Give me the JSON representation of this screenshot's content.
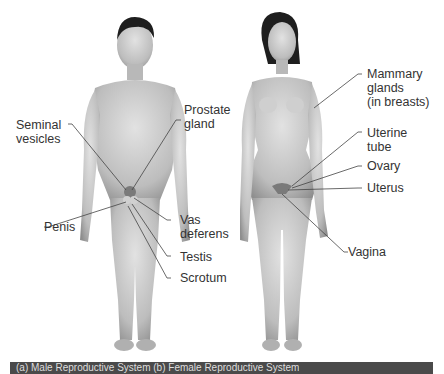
{
  "figures": {
    "male": {
      "labels": [
        {
          "id": "seminal-vesicles",
          "text": "Seminal\nvesicles"
        },
        {
          "id": "prostate-gland",
          "text": "Prostate\ngland"
        },
        {
          "id": "penis",
          "text": "Penis"
        },
        {
          "id": "vas-deferens",
          "text": "Vas\ndeferens"
        },
        {
          "id": "testis",
          "text": "Testis"
        },
        {
          "id": "scrotum",
          "text": "Scrotum"
        }
      ]
    },
    "female": {
      "labels": [
        {
          "id": "mammary-glands",
          "text": "Mammary\nglands\n(in breasts)"
        },
        {
          "id": "uterine-tube",
          "text": "Uterine\ntube"
        },
        {
          "id": "ovary",
          "text": "Ovary"
        },
        {
          "id": "uterus",
          "text": "Uterus"
        },
        {
          "id": "vagina",
          "text": "Vagina"
        }
      ]
    }
  },
  "caption": {
    "text": "(a) Male Reproductive System     (b) Female Reproductive System"
  },
  "colors": {
    "skin": "#bdbdbd",
    "hair": "#1e1e1e",
    "label_text": "#333333",
    "caption_bar": "#4a4a4a"
  }
}
